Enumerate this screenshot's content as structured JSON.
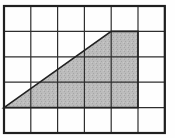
{
  "figure": {
    "grid": {
      "cols": 6,
      "rows": 5,
      "cell_w": 26.8,
      "cell_h": 25.4,
      "origin_x": 4,
      "origin_y": 6
    },
    "shaded_polygon_cells": [
      [
        0,
        4
      ],
      [
        4,
        1
      ],
      [
        5,
        1
      ],
      [
        5,
        4
      ]
    ],
    "colors": {
      "background": "#fefefe",
      "grid_line": "#2e2e2e",
      "outer_border": "#1f1f1f",
      "shade_base": "#bcbcbc",
      "shade_dot_dark": "#a6a6a6",
      "shade_dot_light": "#c9c9c9",
      "diagonal_line": "#222222"
    },
    "line_width_grid": 1.2,
    "line_width_border": 2.2,
    "line_width_diagonal": 1.6
  },
  "chart_data": {
    "type": "table",
    "title": "",
    "note_grid_cols": 6,
    "note_grid_rows": 5,
    "shaded_vertices_grid_units": [
      [
        0,
        4
      ],
      [
        4,
        1
      ],
      [
        5,
        1
      ],
      [
        5,
        4
      ]
    ],
    "shaded_area_square_units": 7.5
  }
}
